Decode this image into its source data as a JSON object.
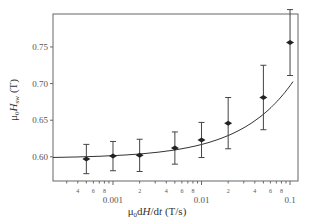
{
  "chart_data": {
    "type": "scatter",
    "title": "",
    "xlabel": "μ0dH/dt (T/s)",
    "ylabel": "μ0Hsw (T)",
    "xscale": "log",
    "xlim": [
      0.00021,
      0.123
    ],
    "ylim": [
      0.567,
      0.795
    ],
    "grid": false,
    "legend": null,
    "x_major_ticks": [
      {
        "value": 0.001,
        "label": "0.001"
      },
      {
        "value": 0.01,
        "label": "0.01"
      },
      {
        "value": 0.1,
        "label": "0.1"
      }
    ],
    "x_minor_labels": [
      {
        "value": 0.0004,
        "label": "4"
      },
      {
        "value": 0.0006,
        "label": "6"
      },
      {
        "value": 0.0008,
        "label": "8"
      },
      {
        "value": 0.002,
        "label": "2"
      },
      {
        "value": 0.004,
        "label": "4"
      },
      {
        "value": 0.006,
        "label": "6"
      },
      {
        "value": 0.008,
        "label": "8"
      },
      {
        "value": 0.02,
        "label": "2"
      },
      {
        "value": 0.04,
        "label": "4"
      },
      {
        "value": 0.06,
        "label": "6"
      },
      {
        "value": 0.08,
        "label": "8"
      }
    ],
    "y_ticks": [
      {
        "value": 0.6,
        "label": "0.60"
      },
      {
        "value": 0.65,
        "label": "0.65"
      },
      {
        "value": 0.7,
        "label": "0.70"
      },
      {
        "value": 0.75,
        "label": "0.75"
      }
    ],
    "series": [
      {
        "name": "measured",
        "marker": "diamond",
        "x": [
          0.0005,
          0.001,
          0.002,
          0.005,
          0.01,
          0.02,
          0.05,
          0.1
        ],
        "y": [
          0.597,
          0.601,
          0.602,
          0.612,
          0.623,
          0.646,
          0.681,
          0.756
        ],
        "yerr": [
          0.02,
          0.02,
          0.022,
          0.022,
          0.024,
          0.035,
          0.044,
          0.045
        ]
      },
      {
        "name": "fit",
        "style": "line",
        "description": "smooth fit curve through points, flat near 0.60 rising to ~0.76 at 0.1"
      }
    ]
  },
  "labels": {
    "ylabel_mu": "μ",
    "ylabel_sub0": "0",
    "ylabel_H": "H",
    "ylabel_sub": "sw",
    "ylabel_unit": " (T)",
    "xlabel_mu": "μ",
    "xlabel_sub0": "0",
    "xlabel_d": "d",
    "xlabel_H": "H",
    "xlabel_slash": "/d",
    "xlabel_t": "t",
    "xlabel_unit": " (T/s)"
  }
}
